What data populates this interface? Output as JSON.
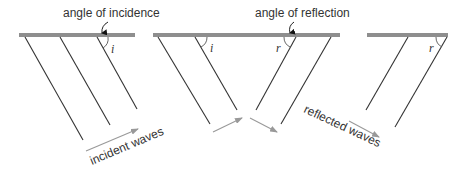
{
  "diagram": {
    "topic": "reflection of waves",
    "colors": {
      "barrier": "#8e8e8e",
      "wave_line": "#333333",
      "arrow": "#999999",
      "text": "#333333"
    },
    "labels": {
      "angle_of_incidence": "angle of incidence",
      "angle_of_reflection": "angle of reflection",
      "incident_waves": "incident waves",
      "reflected_waves": "reflected waves",
      "i_symbol": "i",
      "r_symbol": "r"
    },
    "panels": [
      {
        "name": "incident",
        "barrier": {
          "x1": 19,
          "x2": 135,
          "y": 33,
          "h": 4
        },
        "waves": [
          {
            "x1": 25,
            "y1": 37,
            "x2": 83,
            "y2": 140
          },
          {
            "x1": 60,
            "y1": 37,
            "x2": 110,
            "y2": 125
          },
          {
            "x1": 97,
            "y1": 37,
            "x2": 137,
            "y2": 109
          }
        ],
        "angle_marks": [
          "i"
        ]
      },
      {
        "name": "incident-and-reflected",
        "barrier": {
          "x1": 153,
          "x2": 340,
          "y": 33,
          "h": 4
        },
        "waves": [
          {
            "x1": 158,
            "y1": 37,
            "x2": 210,
            "y2": 124
          },
          {
            "x1": 195,
            "y1": 37,
            "x2": 237,
            "y2": 110
          },
          {
            "x1": 296,
            "y1": 37,
            "x2": 256,
            "y2": 110
          },
          {
            "x1": 331,
            "y1": 37,
            "x2": 281,
            "y2": 124
          }
        ],
        "angle_marks": [
          "i",
          "r"
        ]
      },
      {
        "name": "reflected",
        "barrier": {
          "x1": 367,
          "x2": 448,
          "y": 33,
          "h": 4
        },
        "waves": [
          {
            "x1": 408,
            "y1": 37,
            "x2": 366,
            "y2": 110
          },
          {
            "x1": 447,
            "y1": 37,
            "x2": 395,
            "y2": 127
          }
        ],
        "angle_marks": [
          "r"
        ]
      }
    ]
  }
}
